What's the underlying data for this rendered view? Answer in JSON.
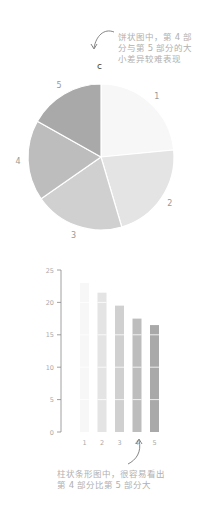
{
  "panel_label": "c",
  "annotations": {
    "pie": "饼状图中，第 4 部分与第 5 部分的大小差异较难表现",
    "bar": "柱状条形图中，很容易看出第 4 部分比第 5 部分大"
  },
  "chart_data": [
    {
      "type": "pie",
      "title": "",
      "categories": [
        "1",
        "2",
        "3",
        "4",
        "5"
      ],
      "values": [
        23,
        21.5,
        19.5,
        17.5,
        16.5
      ],
      "colors": [
        "#f7f7f7",
        "#e4e4e4",
        "#d0d0d0",
        "#bdbdbd",
        "#a9a9a9"
      ],
      "start_angle": "top, clockwise"
    },
    {
      "type": "bar",
      "title": "",
      "categories": [
        "1",
        "2",
        "3",
        "4",
        "5"
      ],
      "values": [
        23,
        21.5,
        19.5,
        17.5,
        16.5
      ],
      "colors": [
        "#f7f7f7",
        "#e4e4e4",
        "#d0d0d0",
        "#bdbdbd",
        "#a9a9a9"
      ],
      "xlabel": "",
      "ylabel": "",
      "yticks": [
        0,
        5,
        10,
        15,
        20,
        25
      ],
      "ylim": [
        0,
        25
      ],
      "grid": "white horizontal lines through bars at 5,10,15,20"
    }
  ]
}
